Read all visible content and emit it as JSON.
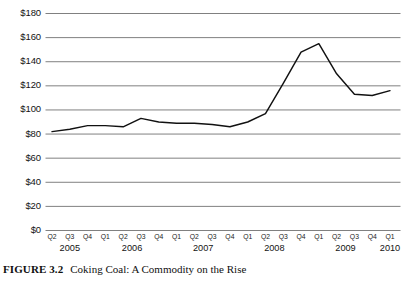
{
  "caption": {
    "label": "FIGURE 3.2",
    "text": "Coking Coal: A Commodity on the Rise"
  },
  "chart_data": {
    "type": "line",
    "title": "Coking Coal: A Commodity on the Rise",
    "xlabel": "",
    "ylabel": "",
    "ylim": [
      0,
      180
    ],
    "yticks": [
      0,
      20,
      40,
      60,
      80,
      100,
      120,
      140,
      160,
      180
    ],
    "ytick_labels": [
      "$0",
      "$20",
      "$40",
      "$60",
      "$80",
      "$100",
      "$120",
      "$140",
      "$160",
      "$180"
    ],
    "grid": true,
    "legend": "none",
    "line_color": "#111111",
    "grid_color": "#808080",
    "categories": [
      "Q2",
      "Q3",
      "Q4",
      "Q1",
      "Q2",
      "Q3",
      "Q4",
      "Q1",
      "Q2",
      "Q3",
      "Q4",
      "Q1",
      "Q2",
      "Q3",
      "Q4",
      "Q1",
      "Q2",
      "Q3",
      "Q4",
      "Q1"
    ],
    "year_groups": [
      {
        "year": "2005",
        "quarters": [
          "Q2",
          "Q3",
          "Q4"
        ]
      },
      {
        "year": "2006",
        "quarters": [
          "Q1",
          "Q2",
          "Q3",
          "Q4"
        ]
      },
      {
        "year": "2007",
        "quarters": [
          "Q1",
          "Q2",
          "Q3",
          "Q4"
        ]
      },
      {
        "year": "2008",
        "quarters": [
          "Q1",
          "Q2",
          "Q3",
          "Q4"
        ]
      },
      {
        "year": "2009",
        "quarters": [
          "Q1",
          "Q2",
          "Q3",
          "Q4"
        ]
      },
      {
        "year": "2010",
        "quarters": [
          "Q1"
        ]
      }
    ],
    "x_labels": [
      "Q2 2005",
      "Q3 2005",
      "Q4 2005",
      "Q1 2006",
      "Q2 2006",
      "Q3 2006",
      "Q4 2006",
      "Q1 2007",
      "Q2 2007",
      "Q3 2007",
      "Q4 2007",
      "Q1 2008",
      "Q2 2008",
      "Q3 2008",
      "Q4 2008",
      "Q1 2009",
      "Q2 2009",
      "Q3 2009",
      "Q4 2009",
      "Q1 2010"
    ],
    "values": [
      82,
      84,
      87,
      87,
      86,
      93,
      90,
      89,
      89,
      88,
      86,
      90,
      97,
      122,
      148,
      155,
      130,
      113,
      112,
      116
    ]
  }
}
